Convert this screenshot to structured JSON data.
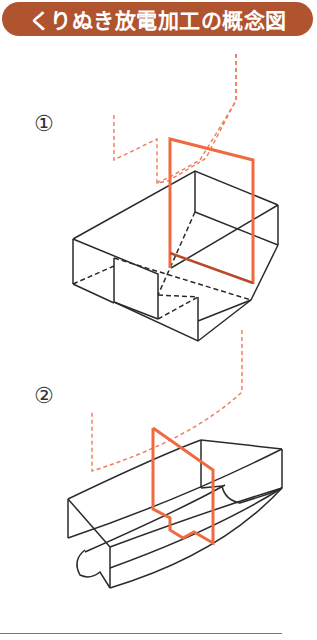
{
  "title": "くりぬき放電加工の概念図",
  "steps": [
    {
      "label": "①",
      "description": "Rectangular electrode wire path cutting an L-shaped hollow block"
    },
    {
      "label": "②",
      "description": "Electrode path cutting a curved channel block"
    }
  ],
  "colors": {
    "title_background": "#b0532f",
    "title_text": "#ffffff",
    "electrode": "#ef6a3f",
    "electrode_path": "#ef7a55",
    "workpiece_line": "#2a2a2a",
    "rule": "#777777"
  }
}
